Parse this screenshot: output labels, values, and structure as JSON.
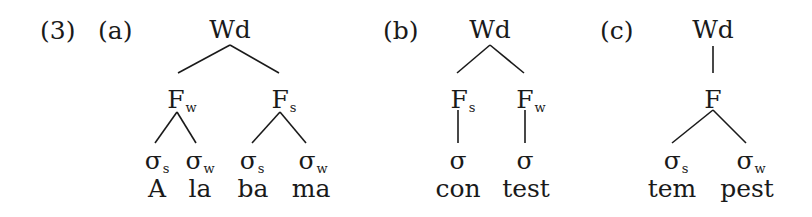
{
  "example_number": "(3)",
  "trees": [
    {
      "label": "(a)",
      "root": "Wd",
      "feet": [
        {
          "base": "F",
          "sub": "w"
        },
        {
          "base": "F",
          "sub": "s"
        }
      ],
      "syllables": [
        {
          "base": "σ",
          "sub": "s"
        },
        {
          "base": "σ",
          "sub": "w"
        },
        {
          "base": "σ",
          "sub": "s"
        },
        {
          "base": "σ",
          "sub": "w"
        }
      ],
      "words": [
        "A",
        "la",
        "ba",
        "ma"
      ]
    },
    {
      "label": "(b)",
      "root": "Wd",
      "feet": [
        {
          "base": "F",
          "sub": "s"
        },
        {
          "base": "F",
          "sub": "w"
        }
      ],
      "syllables": [
        {
          "base": "σ",
          "sub": ""
        },
        {
          "base": "σ",
          "sub": ""
        }
      ],
      "words": [
        "con",
        "test"
      ]
    },
    {
      "label": "(c)",
      "root": "Wd",
      "feet": [
        {
          "base": "F",
          "sub": ""
        }
      ],
      "syllables": [
        {
          "base": "σ",
          "sub": "s"
        },
        {
          "base": "σ",
          "sub": "w"
        }
      ],
      "words": [
        "tem",
        "pest"
      ]
    }
  ]
}
